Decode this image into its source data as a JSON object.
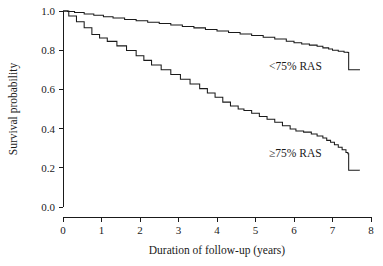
{
  "chart_data": {
    "type": "line",
    "title": "",
    "xlabel": "Duration of follow-up (years)",
    "ylabel": "Survival probability",
    "xlim": [
      0,
      8
    ],
    "ylim": [
      0,
      1.0
    ],
    "xticks": [
      "0",
      "1",
      "2",
      "3",
      "4",
      "5",
      "6",
      "7",
      "8"
    ],
    "yticks": [
      "0.0",
      "0.2",
      "0.4",
      "0.6",
      "0.8",
      "1.0"
    ],
    "xtick_values": [
      0,
      1,
      2,
      3,
      4,
      5,
      6,
      7,
      8
    ],
    "ytick_values": [
      0.0,
      0.2,
      0.4,
      0.6,
      0.8,
      1.0
    ],
    "grid": false,
    "legend_position": "inline-annotations",
    "line_color": "#1a1a1a",
    "series": [
      {
        "name": "<75% RAS",
        "label": "<75% RAS",
        "label_x": 5.35,
        "label_y": 0.7,
        "points": [
          [
            0.0,
            1.0
          ],
          [
            0.12,
            0.997
          ],
          [
            0.3,
            0.992
          ],
          [
            0.55,
            0.985
          ],
          [
            0.8,
            0.978
          ],
          [
            1.05,
            0.971
          ],
          [
            1.3,
            0.964
          ],
          [
            1.6,
            0.957
          ],
          [
            1.9,
            0.95
          ],
          [
            2.2,
            0.943
          ],
          [
            2.5,
            0.936
          ],
          [
            2.8,
            0.929
          ],
          [
            3.1,
            0.921
          ],
          [
            3.4,
            0.914
          ],
          [
            3.7,
            0.906
          ],
          [
            4.0,
            0.898
          ],
          [
            4.3,
            0.89
          ],
          [
            4.6,
            0.883
          ],
          [
            4.9,
            0.875
          ],
          [
            5.2,
            0.866
          ],
          [
            5.5,
            0.857
          ],
          [
            5.8,
            0.846
          ],
          [
            6.0,
            0.838
          ],
          [
            6.2,
            0.832
          ],
          [
            6.4,
            0.826
          ],
          [
            6.6,
            0.82
          ],
          [
            6.75,
            0.812
          ],
          [
            6.9,
            0.806
          ],
          [
            7.0,
            0.8
          ],
          [
            7.15,
            0.795
          ],
          [
            7.3,
            0.79
          ],
          [
            7.4,
            0.788
          ],
          [
            7.42,
            0.7
          ],
          [
            7.7,
            0.698
          ]
        ]
      },
      {
        "name": "≥75% RAS",
        "label": "≥75% RAS",
        "label_x": 5.35,
        "label_y": 0.255,
        "points": [
          [
            0.0,
            1.0
          ],
          [
            0.15,
            0.975
          ],
          [
            0.35,
            0.945
          ],
          [
            0.55,
            0.915
          ],
          [
            0.75,
            0.88
          ],
          [
            0.95,
            0.862
          ],
          [
            1.15,
            0.845
          ],
          [
            1.4,
            0.822
          ],
          [
            1.65,
            0.798
          ],
          [
            1.9,
            0.772
          ],
          [
            2.1,
            0.748
          ],
          [
            2.3,
            0.725
          ],
          [
            2.55,
            0.7
          ],
          [
            2.8,
            0.676
          ],
          [
            3.05,
            0.652
          ],
          [
            3.3,
            0.628
          ],
          [
            3.55,
            0.604
          ],
          [
            3.75,
            0.582
          ],
          [
            3.95,
            0.56
          ],
          [
            4.15,
            0.535
          ],
          [
            4.35,
            0.515
          ],
          [
            4.55,
            0.5
          ],
          [
            4.7,
            0.492
          ],
          [
            4.9,
            0.478
          ],
          [
            5.1,
            0.462
          ],
          [
            5.3,
            0.448
          ],
          [
            5.5,
            0.432
          ],
          [
            5.7,
            0.415
          ],
          [
            5.9,
            0.398
          ],
          [
            6.05,
            0.388
          ],
          [
            6.25,
            0.382
          ],
          [
            6.45,
            0.372
          ],
          [
            6.6,
            0.362
          ],
          [
            6.75,
            0.352
          ],
          [
            6.85,
            0.34
          ],
          [
            6.95,
            0.33
          ],
          [
            7.05,
            0.318
          ],
          [
            7.15,
            0.305
          ],
          [
            7.25,
            0.292
          ],
          [
            7.35,
            0.278
          ],
          [
            7.4,
            0.272
          ],
          [
            7.42,
            0.188
          ],
          [
            7.7,
            0.186
          ]
        ]
      }
    ]
  }
}
